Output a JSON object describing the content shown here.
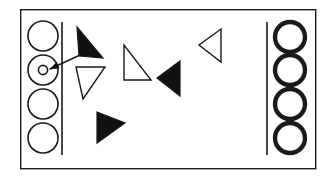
{
  "figure": {
    "canvas": {
      "width": 336,
      "height": 178,
      "background": "#ffffff"
    },
    "stroke_color": "#1a1a1a",
    "fill_color": "#111111",
    "outer_frame": {
      "label": "outer rectangle border",
      "x": 20,
      "y": 9,
      "width": 295,
      "height": 159,
      "stroke_width": 1.4
    },
    "left_divider": {
      "label": "left vertical divider line",
      "x1": 62,
      "y1": 22,
      "x2": 62,
      "y2": 155,
      "stroke_width": 1.6
    },
    "right_divider": {
      "label": "right vertical divider line",
      "x1": 267,
      "y1": 22,
      "x2": 267,
      "y2": 155,
      "stroke_width": 1.6
    },
    "left_circles": {
      "label": "left column of thin outlined circles",
      "count": 4,
      "stroke_width": 1.6,
      "radius": 15,
      "cx": 43,
      "cy_values": [
        36,
        70,
        104,
        138
      ]
    },
    "inner_marker": {
      "label": "small circle inside second left circle",
      "cx": 43,
      "cy": 70,
      "r": 4.6,
      "stroke_width": 1.6
    },
    "pointer_arrow": {
      "label": "arrow pointing at small inner circle",
      "x1": 80,
      "y1": 55,
      "x2": 50,
      "y2": 69,
      "stroke_width": 1.4,
      "head_size": 5
    },
    "right_circles": {
      "label": "right column of thick outlined circles",
      "count": 4,
      "stroke_width": 4.4,
      "radius": 15,
      "cx": 290,
      "cy_values": [
        37,
        70,
        104,
        138
      ]
    },
    "triangles": [
      {
        "id": "triangle-filled-upper-left",
        "style": "filled",
        "points": "77,27 103,58 79,56",
        "stroke_width": 1.2
      },
      {
        "id": "triangle-outlined-left",
        "style": "outlined",
        "points": "76,67 105,67 83,99",
        "stroke_width": 1.4
      },
      {
        "id": "triangle-filled-lower-left",
        "style": "filled",
        "points": "97,112 125,123 97,143",
        "stroke_width": 1.2
      },
      {
        "id": "triangle-outlined-center",
        "style": "outlined",
        "points": "124,45 124,80 151,80",
        "stroke_width": 1.4
      },
      {
        "id": "triangle-filled-center-right",
        "style": "filled",
        "points": "180,61 180,96 157,78",
        "stroke_width": 1.2
      },
      {
        "id": "triangle-outlined-upper-right",
        "style": "outlined",
        "points": "221,29 221,62 199,45",
        "stroke_width": 1.4
      }
    ]
  }
}
